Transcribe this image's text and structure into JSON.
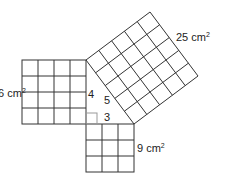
{
  "diagram": {
    "type": "pythagorean-theorem",
    "squares": [
      {
        "name": "left-square",
        "grid": 4,
        "area_label": "16 cm",
        "area_sup": "2"
      },
      {
        "name": "bottom-square",
        "grid": 3,
        "area_label": "9 cm",
        "area_sup": "2"
      },
      {
        "name": "hypotenuse-square",
        "grid": 5,
        "area_label": "25 cm",
        "area_sup": "2"
      }
    ],
    "sides": {
      "a": "4",
      "b": "3",
      "c": "5"
    },
    "line_color": "#333333"
  }
}
